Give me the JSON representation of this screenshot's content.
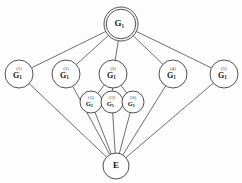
{
  "diagram": {
    "type": "graph",
    "background_color": "#fdfdfd",
    "edge_color": "#4a4a4a",
    "node_fill": "#ffffff",
    "node_stroke": "#3d3d3d",
    "nodes": [
      {
        "id": "root",
        "name": "node-g1-root",
        "base": "G",
        "subscript": "1",
        "superscript": "",
        "cx": 121,
        "cy": 24,
        "r": 17,
        "double_circle": true,
        "size_class": "lg"
      },
      {
        "id": "n1",
        "name": "node-g1-sup1",
        "base": "G",
        "subscript": "1",
        "superscript": "(1)",
        "cx": 19,
        "cy": 74,
        "r": 14,
        "double_circle": false,
        "size_class": "md"
      },
      {
        "id": "n2",
        "name": "node-g1-sup2",
        "base": "G",
        "subscript": "1",
        "superscript": "(2)",
        "cx": 66,
        "cy": 74,
        "r": 14,
        "double_circle": false,
        "size_class": "md"
      },
      {
        "id": "n3",
        "name": "node-g1-sup3",
        "base": "G",
        "subscript": "1",
        "superscript": "(3)",
        "cx": 113,
        "cy": 74,
        "r": 14,
        "double_circle": false,
        "size_class": "md"
      },
      {
        "id": "n4",
        "name": "node-g1-sup4",
        "base": "G",
        "subscript": "1",
        "superscript": "(4)",
        "cx": 173,
        "cy": 74,
        "r": 14,
        "double_circle": false,
        "size_class": "md"
      },
      {
        "id": "n5",
        "name": "node-g1-sup5",
        "base": "G",
        "subscript": "1",
        "superscript": "(5)",
        "cx": 224,
        "cy": 74,
        "r": 14,
        "double_circle": false,
        "size_class": "md"
      },
      {
        "id": "n11",
        "name": "node-g1-sup11",
        "base": "G",
        "subscript": "1",
        "superscript": "(11)",
        "cx": 91,
        "cy": 102,
        "r": 11,
        "double_circle": false,
        "size_class": "sm"
      },
      {
        "id": "n13",
        "name": "node-g1-sup13",
        "base": "G",
        "subscript": "1",
        "superscript": "(13)",
        "cx": 112,
        "cy": 102,
        "r": 11,
        "double_circle": false,
        "size_class": "sm"
      },
      {
        "id": "n10",
        "name": "node-g1-sup10",
        "base": "G",
        "subscript": "1",
        "superscript": "(10)",
        "cx": 133,
        "cy": 102,
        "r": 11,
        "double_circle": false,
        "size_class": "sm"
      },
      {
        "id": "e",
        "name": "node-e-identity",
        "base": "E",
        "subscript": "",
        "superscript": "",
        "cx": 116,
        "cy": 166,
        "r": 13,
        "double_circle": false,
        "size_class": "lg"
      }
    ],
    "edges": [
      {
        "name": "edge-root-sup1",
        "from": "root",
        "to": "n1"
      },
      {
        "name": "edge-root-sup2",
        "from": "root",
        "to": "n2"
      },
      {
        "name": "edge-root-sup3",
        "from": "root",
        "to": "n3"
      },
      {
        "name": "edge-root-sup4",
        "from": "root",
        "to": "n4"
      },
      {
        "name": "edge-root-sup5",
        "from": "root",
        "to": "n5"
      },
      {
        "name": "edge-sup3-sup11",
        "from": "n3",
        "to": "n11"
      },
      {
        "name": "edge-sup3-sup13",
        "from": "n3",
        "to": "n13"
      },
      {
        "name": "edge-sup3-sup10",
        "from": "n3",
        "to": "n10"
      },
      {
        "name": "edge-sup1-e",
        "from": "n1",
        "to": "e"
      },
      {
        "name": "edge-sup2-e",
        "from": "n2",
        "to": "e"
      },
      {
        "name": "edge-sup4-e",
        "from": "n4",
        "to": "e"
      },
      {
        "name": "edge-sup5-e",
        "from": "n5",
        "to": "e"
      },
      {
        "name": "edge-sup11-e",
        "from": "n11",
        "to": "e"
      },
      {
        "name": "edge-sup13-e",
        "from": "n13",
        "to": "e"
      },
      {
        "name": "edge-sup10-e",
        "from": "n10",
        "to": "e"
      }
    ]
  }
}
